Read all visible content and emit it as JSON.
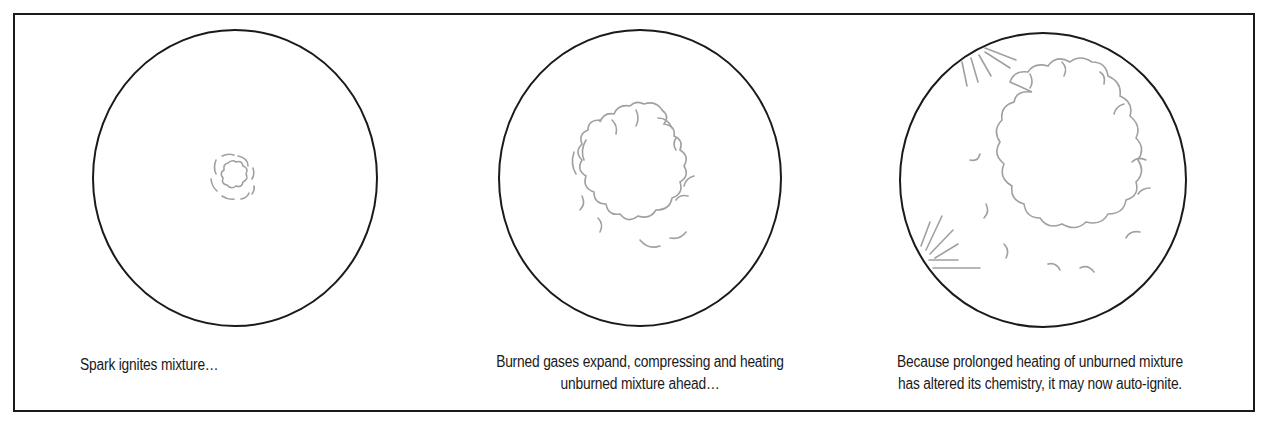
{
  "diagram": {
    "colors": {
      "frame": "#1a1a1a",
      "chamber_outline": "#1a1a1a",
      "flame_front": "#a0a0a0",
      "text": "#1a1a1a",
      "background": "#ffffff"
    },
    "panels": [
      {
        "id": "stage-1",
        "caption_lines": [
          "Spark ignites mixture…"
        ],
        "flame_size": "small kernel"
      },
      {
        "id": "stage-2",
        "caption_lines": [
          "Burned gases expand, compressing and heating",
          "unburned mixture ahead…"
        ],
        "flame_size": "medium flame front"
      },
      {
        "id": "stage-3",
        "caption_lines": [
          "Because prolonged heating of unburned mixture",
          "has altered its chemistry, it may now auto-ignite."
        ],
        "flame_size": "large flame front with auto-ignition sparks"
      }
    ]
  }
}
